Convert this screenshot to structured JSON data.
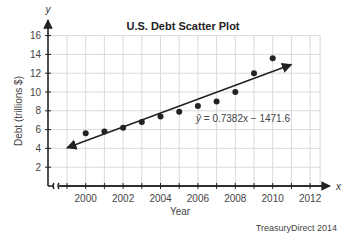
{
  "chart_data": {
    "type": "scatter",
    "title": "U.S. Debt Scatter Plot",
    "xlabel": "Year",
    "ylabel": "Debt (trillions $)",
    "x_axis_var": "x",
    "y_axis_var": "y",
    "xlim": [
      1999,
      2012
    ],
    "ylim": [
      0,
      16
    ],
    "x_ticks": [
      2000,
      2002,
      2004,
      2006,
      2008,
      2010,
      2012
    ],
    "y_ticks": [
      2,
      4,
      6,
      8,
      10,
      12,
      14,
      16
    ],
    "grid": true,
    "x_axis_break": true,
    "series": [
      {
        "name": "U.S. Debt",
        "x": [
          2000,
          2001,
          2002,
          2003,
          2004,
          2005,
          2006,
          2007,
          2008,
          2009,
          2010
        ],
        "y": [
          5.6,
          5.8,
          6.2,
          6.8,
          7.4,
          7.9,
          8.5,
          9.0,
          10.0,
          12.0,
          13.6
        ]
      }
    ],
    "regression": {
      "equation": "ŷ = 0.7382x − 1471.6",
      "slope": 0.7382,
      "intercept": -1471.6,
      "x_start": 1999,
      "x_end": 2011
    },
    "source": "TreasuryDirect 2014"
  },
  "labels": {
    "title": "U.S. Debt Scatter Plot",
    "xlabel": "Year",
    "ylabel": "Debt (trillions $)",
    "x_var": "x",
    "y_var": "y",
    "equation_prefix": "ŷ",
    "equation_body": " = 0.7382x − 1471.6",
    "source": "TreasuryDirect 2014"
  }
}
